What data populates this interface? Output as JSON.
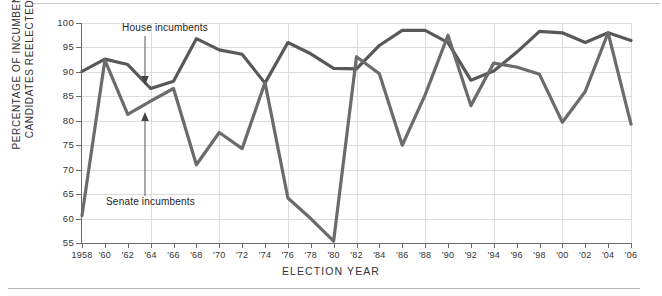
{
  "chart_data": {
    "type": "line",
    "title": "",
    "xlabel": "ELECTION YEAR",
    "ylabel": "PERCENTAGE OF INCUMBENT CANDIDATES REELECTED",
    "xlim": [
      1958,
      2006
    ],
    "ylim": [
      55,
      100
    ],
    "grid": true,
    "legend_position": "inline-annotations",
    "x": [
      1958,
      1960,
      1962,
      1964,
      1966,
      1968,
      1970,
      1972,
      1974,
      1976,
      1978,
      1980,
      1982,
      1984,
      1986,
      1988,
      1990,
      1992,
      1994,
      1996,
      1998,
      2000,
      2002,
      2004,
      2006
    ],
    "categories": [
      "1958",
      "'60",
      "'62",
      "'64",
      "'66",
      "'68",
      "'70",
      "'72",
      "'74",
      "'76",
      "'78",
      "'80",
      "'82",
      "'84",
      "'86",
      "'88",
      "'90",
      "'92",
      "'94",
      "'96",
      "'98",
      "'00",
      "'02",
      "'04",
      "'06"
    ],
    "series": [
      {
        "name": "House incumbents",
        "color": "#585858",
        "values": [
          90.1,
          92.6,
          91.5,
          86.6,
          88.1,
          96.8,
          94.5,
          93.6,
          87.7,
          96.0,
          93.7,
          90.7,
          90.6,
          95.4,
          98.5,
          98.5,
          96.0,
          88.3,
          90.2,
          94.0,
          98.3,
          98.0,
          96.0,
          98.0,
          96.4
        ],
        "annotation": "House incumbents"
      },
      {
        "name": "Senate incumbents",
        "color": "#6b6b6b",
        "values": [
          60.6,
          92.4,
          81.3,
          84.0,
          86.6,
          71.0,
          77.6,
          74.3,
          87.8,
          64.2,
          60.0,
          55.4,
          93.1,
          89.6,
          75.0,
          85.3,
          97.5,
          83.1,
          91.8,
          91.0,
          89.5,
          79.7,
          86.0,
          98.0,
          79.3
        ]
      }
    ]
  },
  "axis": {
    "y_ticks": [
      "100",
      "95",
      "90",
      "85",
      "80",
      "75",
      "70",
      "65",
      "60",
      "55"
    ],
    "x_ticks": [
      "1958",
      "'60",
      "'62",
      "'64",
      "'66",
      "'68",
      "'70",
      "'72",
      "'74",
      "'76",
      "'78",
      "'80",
      "'82",
      "'84",
      "'86",
      "'88",
      "'90",
      "'92",
      "'94",
      "'96",
      "'98",
      "'00",
      "'02",
      "'04",
      "'06"
    ],
    "y_title": "PERCENTAGE OF INCUMBENT CANDIDATES REELECTED",
    "x_title": "ELECTION YEAR"
  },
  "annotations": {
    "house": "House incumbents",
    "senate": "Senate incumbents"
  },
  "colors": {
    "line": "#585858",
    "grid": "#dcdcdc",
    "axis": "#6a6a6a",
    "text": "#333333"
  }
}
